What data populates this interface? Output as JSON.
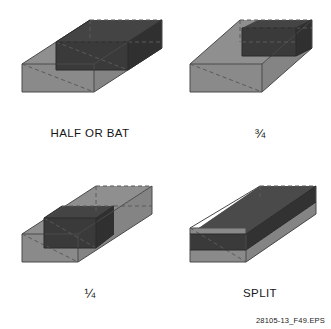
{
  "figure": {
    "credit": "28105-13_F49.EPS",
    "colors": {
      "background": "#ffffff",
      "brick_face_light": "#8a8a8a",
      "brick_face_top": "#8f8f8f",
      "brick_face_end": "#848484",
      "cut_dark": "#3a3a3a",
      "cut_dark_top": "#444444",
      "cut_dark_end": "#303030",
      "edge_solid": "#4a4a4a",
      "edge_dashed": "#5a5a5a",
      "text": "#151515"
    },
    "panels": [
      {
        "id": "half-or-bat",
        "label": "HALF OR BAT",
        "cut_description": "dark half block centered on brick, half length retained",
        "fraction_retained": "1/2"
      },
      {
        "id": "three-quarter",
        "label": "¾",
        "cut_description": "dark block occupying three quarters of brick length at far end",
        "fraction_retained": "3/4"
      },
      {
        "id": "quarter",
        "label": "¼",
        "cut_description": "dark block occupying one quarter of brick length at near end",
        "fraction_retained": "1/4"
      },
      {
        "id": "split",
        "label": "SPLIT",
        "cut_description": "dark slab spanning full brick length, reduced height",
        "fraction_retained": "split"
      }
    ]
  }
}
